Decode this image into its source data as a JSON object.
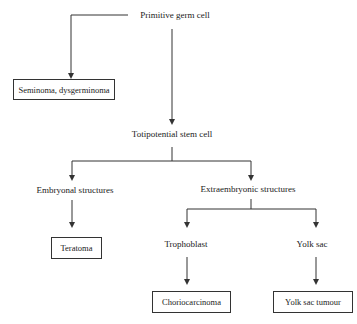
{
  "diagram": {
    "nodes": {
      "primitive_germ_cell": "Primitive germ cell",
      "seminoma": "Seminoma, dysgerminoma",
      "totipotential": "Totipotential stem cell",
      "embryonal": "Embryonal structures",
      "extraembryonic": "Extraembryonic structures",
      "teratoma": "Teratoma",
      "trophoblast": "Trophoblast",
      "yolk_sac": "Yolk sac",
      "choriocarcinoma": "Choriocarcinoma",
      "yolk_sac_tumour": "Yolk sac tumour"
    },
    "edges": [
      [
        "Primitive germ cell",
        "Seminoma, dysgerminoma"
      ],
      [
        "Primitive germ cell",
        "Totipotential stem cell"
      ],
      [
        "Totipotential stem cell",
        "Embryonal structures"
      ],
      [
        "Totipotential stem cell",
        "Extraembryonic structures"
      ],
      [
        "Embryonal structures",
        "Teratoma"
      ],
      [
        "Extraembryonic structures",
        "Trophoblast"
      ],
      [
        "Extraembryonic structures",
        "Yolk sac"
      ],
      [
        "Trophoblast",
        "Choriocarcinoma"
      ],
      [
        "Yolk sac",
        "Yolk sac tumour"
      ]
    ],
    "line_color": "#333333"
  }
}
